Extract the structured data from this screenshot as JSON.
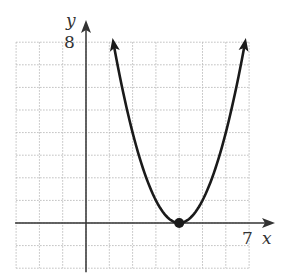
{
  "chart_data": {
    "type": "line",
    "title": "",
    "xlabel": "x",
    "ylabel": "y",
    "xlim": [
      -3,
      7
    ],
    "ylim": [
      -2,
      8
    ],
    "grid": true,
    "tick_labels": {
      "x": [
        "7"
      ],
      "y": [
        "8"
      ]
    },
    "series": [
      {
        "name": "parabola",
        "equation": "y = (x - 4)^2",
        "x": [
          1.17,
          1.5,
          2,
          2.5,
          3,
          3.5,
          4,
          4.5,
          5,
          5.5,
          6,
          6.5,
          6.83
        ],
        "y": [
          8,
          6.25,
          4,
          2.25,
          1,
          0.25,
          0,
          0.25,
          1,
          2.25,
          4,
          6.25,
          8
        ],
        "arrows_both_ends": true
      }
    ],
    "points": [
      {
        "x": 4,
        "y": 0,
        "label": "vertex"
      }
    ]
  },
  "labels": {
    "y_axis": "y",
    "x_axis": "x",
    "y_tick": "8",
    "x_tick": "7"
  },
  "colors": {
    "curve": "#1a1a1a",
    "axis": "#333333",
    "grid": "#bdbdbd"
  }
}
